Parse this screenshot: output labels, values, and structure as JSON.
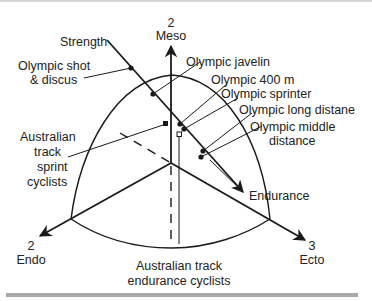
{
  "figure": {
    "type": "somatochart",
    "axes": {
      "meso": {
        "number": "2",
        "label": "Meso"
      },
      "endo": {
        "number": "2",
        "label": "Endo"
      },
      "ecto": {
        "number": "3",
        "label": "Ecto"
      }
    },
    "gradient_line": {
      "start_label": "Strength",
      "end_label": "Endurance"
    },
    "annotations": [
      {
        "label_line1": "Olympic shot",
        "label_line2": "& discus"
      },
      {
        "label_line1": "Olympic javelin"
      },
      {
        "label_line1": "Olympic 400 m"
      },
      {
        "label_line1": "Olympic sprinter"
      },
      {
        "label_line1": "Olympic long distane"
      },
      {
        "label_line1": "Olympic middle",
        "label_line2": "distance"
      },
      {
        "label_line1": "Australian",
        "label_line2": "track",
        "label_line3": "sprint",
        "label_line4": "cyclists"
      },
      {
        "label_line1": "Australian track",
        "label_line2": "endurance cyclists"
      }
    ]
  },
  "colors": {
    "line": "#1a1a1a",
    "text": "#222222",
    "rule": "#a9a9a9"
  }
}
